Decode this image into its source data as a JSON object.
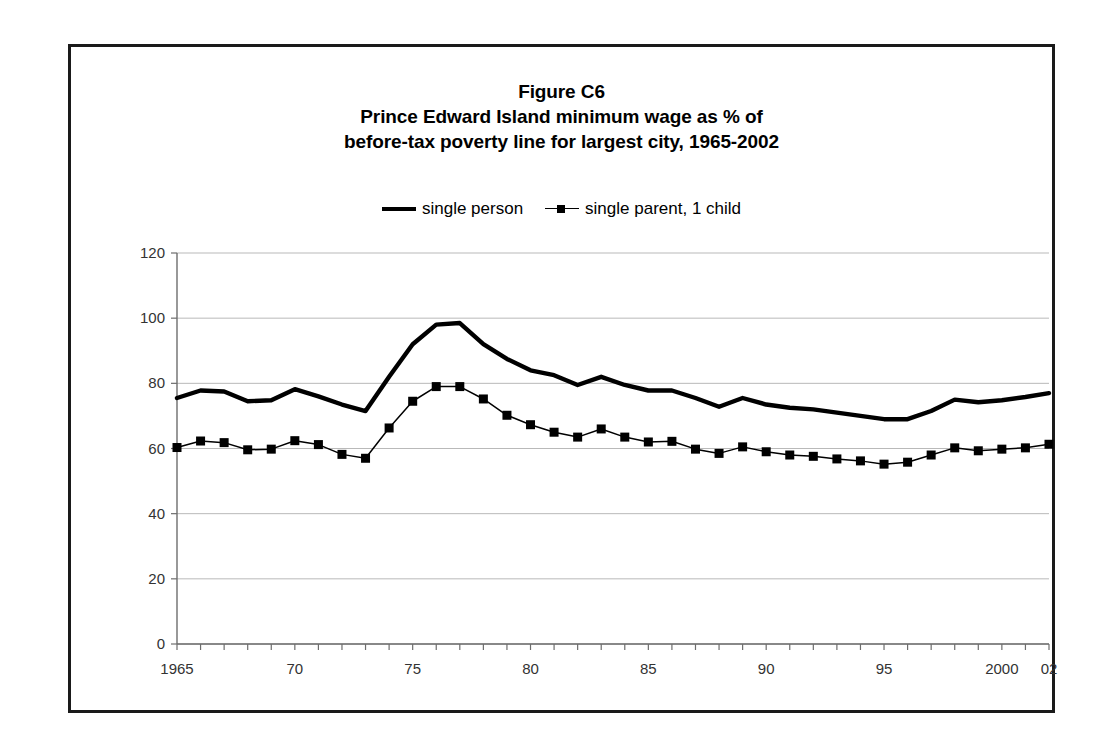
{
  "figure": {
    "title_lines": [
      "Figure C6",
      "Prince Edward Island minimum wage as % of",
      "before-tax poverty line for largest city, 1965-2002"
    ]
  },
  "legend": {
    "entries": [
      {
        "label": "single person",
        "style": "thick-line",
        "color": "#000000"
      },
      {
        "label": "single parent, 1 child",
        "style": "line-with-square-marker",
        "color": "#000000"
      }
    ]
  },
  "axes": {
    "y_ticks": [
      "0",
      "20",
      "40",
      "60",
      "80",
      "100",
      "120"
    ],
    "x_ticks": [
      {
        "value": 1965,
        "label": "1965"
      },
      {
        "value": 1970,
        "label": "70"
      },
      {
        "value": 1975,
        "label": "75"
      },
      {
        "value": 1980,
        "label": "80"
      },
      {
        "value": 1985,
        "label": "85"
      },
      {
        "value": 1990,
        "label": "90"
      },
      {
        "value": 1995,
        "label": "95"
      },
      {
        "value": 2000,
        "label": "2000"
      },
      {
        "value": 2002,
        "label": "02"
      }
    ]
  },
  "chart_data": {
    "type": "line",
    "xlabel": "",
    "ylabel": "",
    "xlim": [
      1965,
      2002
    ],
    "ylim": [
      0,
      120
    ],
    "grid": true,
    "legend_position": "top-center",
    "x": [
      1965,
      1966,
      1967,
      1968,
      1969,
      1970,
      1971,
      1972,
      1973,
      1974,
      1975,
      1976,
      1977,
      1978,
      1979,
      1980,
      1981,
      1982,
      1983,
      1984,
      1985,
      1986,
      1987,
      1988,
      1989,
      1990,
      1991,
      1992,
      1993,
      1994,
      1995,
      1996,
      1997,
      1998,
      1999,
      2000,
      2001,
      2002
    ],
    "series": [
      {
        "name": "single person",
        "values": [
          75.5,
          77.8,
          77.5,
          74.5,
          74.8,
          78.2,
          76.0,
          73.5,
          71.5,
          82.0,
          92.0,
          98.0,
          98.5,
          92.0,
          87.5,
          84.0,
          82.5,
          79.5,
          82.0,
          79.5,
          77.8,
          77.8,
          75.5,
          72.8,
          75.5,
          73.5,
          72.5,
          72.0,
          71.0,
          70.0,
          69.0,
          69.0,
          71.5,
          75.0,
          74.2,
          74.8,
          75.8,
          77.0
        ]
      },
      {
        "name": "single parent, 1 child",
        "values": [
          60.3,
          62.3,
          61.8,
          59.6,
          59.8,
          62.4,
          61.2,
          58.2,
          57.0,
          66.3,
          74.5,
          79.0,
          79.0,
          75.2,
          70.2,
          67.3,
          65.0,
          63.5,
          66.0,
          63.5,
          62.0,
          62.2,
          59.8,
          58.5,
          60.5,
          59.0,
          58.0,
          57.6,
          56.8,
          56.2,
          55.2,
          55.8,
          58.0,
          60.2,
          59.3,
          59.8,
          60.2,
          61.3
        ]
      }
    ]
  }
}
